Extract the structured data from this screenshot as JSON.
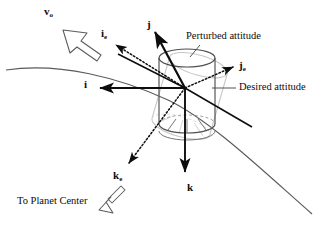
{
  "figure": {
    "background_color": "#ffffff",
    "width": 328,
    "height": 233
  },
  "colors": {
    "ink": "#0d0d0d",
    "orbit": "#555555",
    "desired_body": "#b9b9b9",
    "perturbed_body": "#3a3a3a",
    "hollow_arrow_stroke": "#4a4a4a"
  },
  "labels": {
    "orbital_velocity": {
      "symbol": "v",
      "subscript": "o",
      "text": "vo"
    },
    "i_error": {
      "symbol": "i",
      "subscript": "e",
      "text": "ie"
    },
    "j_body": {
      "symbol": "j",
      "subscript": "",
      "text": "j"
    },
    "i_body": {
      "symbol": "i",
      "subscript": "",
      "text": "i"
    },
    "j_error": {
      "symbol": "j",
      "subscript": "e",
      "text": "je"
    },
    "k_error": {
      "symbol": "k",
      "subscript": "e",
      "text": "ke"
    },
    "k_body": {
      "symbol": "k",
      "subscript": "",
      "text": "k"
    },
    "perturbed_attitude": "Perturbed attitude",
    "desired_attitude": "Desired attitude",
    "to_planet_center": "To Planet Center"
  },
  "geometry": {
    "origin": {
      "x": 185,
      "y": 88
    },
    "vectors": [
      {
        "name": "i-body",
        "style": "solid",
        "from": [
          185,
          88
        ],
        "to": [
          98,
          88
        ]
      },
      {
        "name": "j-body",
        "style": "solid",
        "from": [
          185,
          88
        ],
        "to": [
          153,
          30
        ]
      },
      {
        "name": "k-body",
        "style": "solid",
        "from": [
          185,
          88
        ],
        "to": [
          185,
          176
        ]
      },
      {
        "name": "i-error",
        "style": "dotted",
        "from": [
          185,
          88
        ],
        "to": [
          113,
          44
        ]
      },
      {
        "name": "j-error",
        "style": "dotted",
        "from": [
          185,
          88
        ],
        "to": [
          236,
          66
        ]
      },
      {
        "name": "k-error",
        "style": "dotted",
        "from": [
          185,
          88
        ],
        "to": [
          126,
          167
        ]
      },
      {
        "name": "body-diagonal",
        "style": "solid",
        "from": [
          185,
          88
        ],
        "to": [
          252,
          127
        ]
      },
      {
        "name": "body-diagonal-upleft",
        "style": "solid",
        "from": [
          185,
          88
        ],
        "to": [
          118,
          54
        ]
      }
    ],
    "hollow_arrows": [
      {
        "name": "orbital-velocity-arrow",
        "from": [
          76,
          36
        ],
        "to": [
          52,
          19
        ]
      },
      {
        "name": "to-planet-center-arrow",
        "from": [
          113,
          188
        ],
        "to": [
          95,
          211
        ]
      }
    ],
    "orbit_path": "curve from upper-left to lower-right through spacecraft",
    "perturbed_cylinder": {
      "cx": 187,
      "top_y": 58,
      "bottom_y": 124,
      "rx": 28,
      "ry": 9
    },
    "desired_cylinder": {
      "cx": 190,
      "top_y": 62,
      "bottom_y": 130,
      "rx": 30,
      "ry": 10,
      "tilt_deg": 16
    },
    "leader_lines": [
      {
        "name": "perturbed-leader",
        "from": [
          201,
          44
        ],
        "to": [
          190,
          57
        ]
      },
      {
        "name": "desired-leader",
        "from": [
          236,
          88
        ],
        "to": [
          212,
          88
        ]
      }
    ]
  }
}
